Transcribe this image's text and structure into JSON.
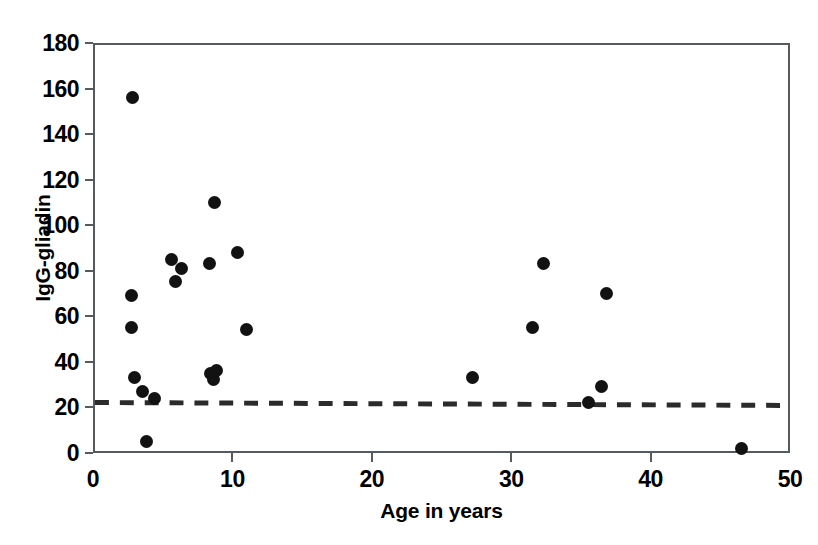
{
  "chart_data": {
    "type": "scatter",
    "title": "",
    "xlabel": "Age in years",
    "ylabel": "IgG-gliadin",
    "xlim": [
      0,
      50
    ],
    "ylim": [
      0,
      180
    ],
    "xticks": [
      0,
      10,
      20,
      30,
      40,
      50
    ],
    "yticks": [
      0,
      20,
      40,
      60,
      80,
      100,
      120,
      140,
      160,
      180
    ],
    "grid": false,
    "legend": "none",
    "marker": "filled-circle",
    "marker_color": "#121212",
    "frame_color": "#555a5e",
    "series": [
      {
        "name": "IgG-gliadin vs age",
        "points": [
          {
            "x": 2.7,
            "y": 157
          },
          {
            "x": 2.6,
            "y": 70
          },
          {
            "x": 2.6,
            "y": 56
          },
          {
            "x": 2.8,
            "y": 34
          },
          {
            "x": 3.4,
            "y": 28
          },
          {
            "x": 3.7,
            "y": 6
          },
          {
            "x": 4.3,
            "y": 25
          },
          {
            "x": 5.5,
            "y": 86
          },
          {
            "x": 5.8,
            "y": 76
          },
          {
            "x": 6.2,
            "y": 82
          },
          {
            "x": 8.2,
            "y": 84
          },
          {
            "x": 8.3,
            "y": 36
          },
          {
            "x": 8.5,
            "y": 33
          },
          {
            "x": 8.7,
            "y": 37
          },
          {
            "x": 8.6,
            "y": 111
          },
          {
            "x": 10.2,
            "y": 89
          },
          {
            "x": 10.9,
            "y": 55
          },
          {
            "x": 27.1,
            "y": 34
          },
          {
            "x": 31.4,
            "y": 56
          },
          {
            "x": 32.2,
            "y": 84
          },
          {
            "x": 35.4,
            "y": 23
          },
          {
            "x": 36.3,
            "y": 30
          },
          {
            "x": 36.7,
            "y": 71
          },
          {
            "x": 46.4,
            "y": 3
          }
        ]
      }
    ],
    "threshold_line": {
      "style": "dashed",
      "color": "#2b2b2b",
      "x_start": 0,
      "y_start": 21.5,
      "x_end": 50,
      "y_end": 20.2,
      "label": ""
    }
  }
}
